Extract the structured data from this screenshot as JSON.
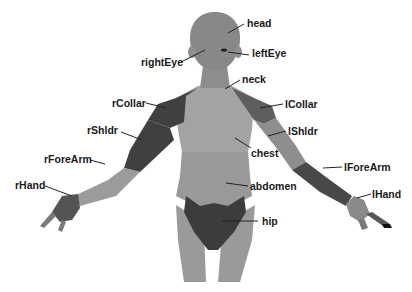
{
  "diagram": {
    "type": "body-part-segmentation",
    "colors": {
      "background": "#ffffff",
      "skin_mid": "#8a8a8a",
      "skin_light": "#a6a6a6",
      "skin_dark": "#3a3a3a",
      "segment_dark": "#454545",
      "segment_medium": "#5e5e5e",
      "label_text": "#1a1a1a",
      "leader_line": "#222222"
    },
    "labels": {
      "head": "head",
      "leftEye": "leftEye",
      "rightEye": "rightEye",
      "neck": "neck",
      "rCollar": "rCollar",
      "lCollar": "lCollar",
      "rShldr": "rShldr",
      "lShldr": "lShldr",
      "chest": "chest",
      "rForeArm": "rForeArm",
      "lForeArm": "lForeArm",
      "abdomen": "abdomen",
      "rHand": "rHand",
      "lHand": "lHand",
      "hip": "hip"
    }
  }
}
